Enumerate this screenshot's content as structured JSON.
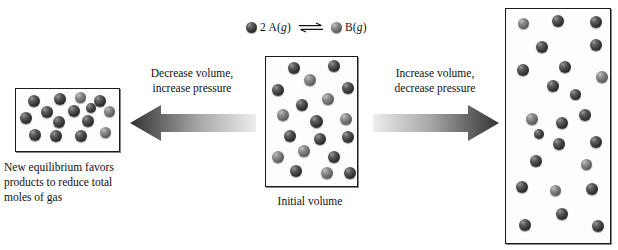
{
  "diagram": {
    "legend": {
      "reactant_coefficient_label": "2 A(g)",
      "product_label": "B(g)",
      "equilibrium_symbol": "equilibrium-double-arrow",
      "reactant_color": "#2b2b2b",
      "product_color": "#5e5e5e"
    },
    "arrows": {
      "left": {
        "label_line1": "Decrease volume,",
        "label_line2": "increase pressure",
        "direction": "left",
        "gradient_from": "#e8e8e8",
        "gradient_to": "#3a3a3a"
      },
      "right": {
        "label_line1": "Increase volume,",
        "label_line2": "decrease pressure",
        "direction": "right",
        "gradient_from": "#e8e8e8",
        "gradient_to": "#3a3a3a"
      }
    },
    "containers": {
      "left": {
        "caption_line1": "New equilibrium favors",
        "caption_line2": "products to reduce total",
        "caption_line3": "moles of gas",
        "particle_count": 15
      },
      "center": {
        "caption": "Initial volume",
        "particle_count": 19
      },
      "right": {
        "caption": "",
        "particle_count": 24
      }
    }
  },
  "particles": {
    "left_box": [
      {
        "x": 12,
        "y": 6,
        "d": 12,
        "type": "dark"
      },
      {
        "x": 38,
        "y": 4,
        "d": 12,
        "type": "dark"
      },
      {
        "x": 59,
        "y": 3,
        "d": 11,
        "type": "light"
      },
      {
        "x": 78,
        "y": 6,
        "d": 12,
        "type": "dark"
      },
      {
        "x": 25,
        "y": 17,
        "d": 12,
        "type": "dark"
      },
      {
        "x": 52,
        "y": 16,
        "d": 12,
        "type": "dark"
      },
      {
        "x": 88,
        "y": 17,
        "d": 11,
        "type": "light"
      },
      {
        "x": 4,
        "y": 23,
        "d": 12,
        "type": "dark"
      },
      {
        "x": 37,
        "y": 27,
        "d": 12,
        "type": "dark"
      },
      {
        "x": 66,
        "y": 26,
        "d": 12,
        "type": "dark"
      },
      {
        "x": 13,
        "y": 40,
        "d": 12,
        "type": "dark"
      },
      {
        "x": 34,
        "y": 41,
        "d": 12,
        "type": "dark"
      },
      {
        "x": 59,
        "y": 41,
        "d": 12,
        "type": "dark"
      },
      {
        "x": 84,
        "y": 38,
        "d": 11,
        "type": "light"
      },
      {
        "x": 70,
        "y": 14,
        "d": 10,
        "type": "dark"
      }
    ],
    "center_box": [
      {
        "x": 22,
        "y": 5,
        "d": 12,
        "type": "dark"
      },
      {
        "x": 62,
        "y": 3,
        "d": 12,
        "type": "dark"
      },
      {
        "x": 38,
        "y": 17,
        "d": 12,
        "type": "light"
      },
      {
        "x": 6,
        "y": 27,
        "d": 12,
        "type": "dark"
      },
      {
        "x": 76,
        "y": 25,
        "d": 12,
        "type": "dark"
      },
      {
        "x": 56,
        "y": 36,
        "d": 12,
        "type": "light"
      },
      {
        "x": 30,
        "y": 42,
        "d": 12,
        "type": "dark"
      },
      {
        "x": 11,
        "y": 52,
        "d": 12,
        "type": "light"
      },
      {
        "x": 44,
        "y": 58,
        "d": 13,
        "type": "dark"
      },
      {
        "x": 74,
        "y": 56,
        "d": 12,
        "type": "light"
      },
      {
        "x": 18,
        "y": 73,
        "d": 12,
        "type": "dark"
      },
      {
        "x": 48,
        "y": 76,
        "d": 12,
        "type": "dark"
      },
      {
        "x": 76,
        "y": 74,
        "d": 12,
        "type": "dark"
      },
      {
        "x": 32,
        "y": 88,
        "d": 12,
        "type": "light"
      },
      {
        "x": 6,
        "y": 94,
        "d": 12,
        "type": "light"
      },
      {
        "x": 62,
        "y": 94,
        "d": 12,
        "type": "dark"
      },
      {
        "x": 24,
        "y": 108,
        "d": 12,
        "type": "dark"
      },
      {
        "x": 55,
        "y": 110,
        "d": 12,
        "type": "light"
      },
      {
        "x": 78,
        "y": 110,
        "d": 12,
        "type": "dark"
      }
    ],
    "right_box": [
      {
        "x": 12,
        "y": 9,
        "d": 11,
        "type": "light"
      },
      {
        "x": 46,
        "y": 6,
        "d": 12,
        "type": "dark"
      },
      {
        "x": 84,
        "y": 7,
        "d": 12,
        "type": "dark"
      },
      {
        "x": 30,
        "y": 32,
        "d": 12,
        "type": "dark"
      },
      {
        "x": 84,
        "y": 30,
        "d": 12,
        "type": "dark"
      },
      {
        "x": 11,
        "y": 55,
        "d": 12,
        "type": "dark"
      },
      {
        "x": 53,
        "y": 52,
        "d": 12,
        "type": "dark"
      },
      {
        "x": 90,
        "y": 62,
        "d": 12,
        "type": "light"
      },
      {
        "x": 41,
        "y": 71,
        "d": 12,
        "type": "dark"
      },
      {
        "x": 20,
        "y": 104,
        "d": 12,
        "type": "light"
      },
      {
        "x": 50,
        "y": 108,
        "d": 12,
        "type": "dark"
      },
      {
        "x": 73,
        "y": 100,
        "d": 12,
        "type": "dark"
      },
      {
        "x": 47,
        "y": 129,
        "d": 12,
        "type": "dark"
      },
      {
        "x": 84,
        "y": 127,
        "d": 12,
        "type": "dark"
      },
      {
        "x": 24,
        "y": 146,
        "d": 12,
        "type": "dark"
      },
      {
        "x": 75,
        "y": 150,
        "d": 11,
        "type": "light"
      },
      {
        "x": 10,
        "y": 172,
        "d": 12,
        "type": "dark"
      },
      {
        "x": 44,
        "y": 176,
        "d": 11,
        "type": "light"
      },
      {
        "x": 80,
        "y": 174,
        "d": 12,
        "type": "dark"
      },
      {
        "x": 50,
        "y": 199,
        "d": 12,
        "type": "dark"
      },
      {
        "x": 13,
        "y": 210,
        "d": 12,
        "type": "dark"
      },
      {
        "x": 86,
        "y": 211,
        "d": 12,
        "type": "dark"
      },
      {
        "x": 64,
        "y": 80,
        "d": 11,
        "type": "dark"
      },
      {
        "x": 28,
        "y": 120,
        "d": 10,
        "type": "dark"
      }
    ]
  }
}
